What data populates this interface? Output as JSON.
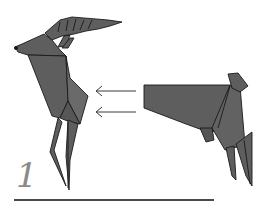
{
  "diagram": {
    "step_number": "1",
    "colors": {
      "paper": "#5e5e5e",
      "paper_light": "#6e6e6e",
      "edge": "#1a1a1a",
      "arrow": "#3a3a3a",
      "step_number": "#8a8a8a",
      "baseline": "#4a4a4a",
      "background": "#ffffff"
    },
    "elements": [
      {
        "name": "origami-deer-front-half",
        "description": "Front half of origami deer: head with antlers, neck, chest and two front legs"
      },
      {
        "name": "origami-deer-back-half",
        "description": "Back half of origami deer: body, rump with tail and two hind legs"
      },
      {
        "name": "assembly-arrows",
        "count": 2,
        "direction": "left",
        "meaning": "Insert back half into front half"
      }
    ]
  }
}
